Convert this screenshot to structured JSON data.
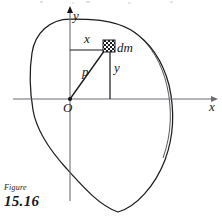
{
  "figure": {
    "caption_word": "Figure",
    "caption_number": "15.16",
    "axes": {
      "y_label": "y",
      "x_label": "x",
      "origin_label": "O"
    },
    "annotations": {
      "horizontal_distance": "x",
      "vertical_distance": "y",
      "radius": "p",
      "mass_element": "dm"
    },
    "colors": {
      "ink": "#15161a",
      "axis": "#6b6d72",
      "outline": "#1b1c20",
      "background": "#ffffff"
    },
    "geometry": {
      "origin_px": [
        70,
        99
      ],
      "mass_element_px": [
        109,
        46
      ],
      "x_axis_span_px": [
        13,
        215
      ],
      "y_axis_span_px": [
        9,
        201
      ],
      "hatch_square_px": [
        103,
        40,
        12,
        12
      ]
    }
  }
}
